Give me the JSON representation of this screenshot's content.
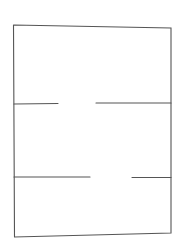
{
  "diagram": {
    "type": "floor-plan-sketch",
    "background": "#ffffff",
    "stroke_color": "#555555",
    "stroke_width": 1.1,
    "outer_wall": {
      "points": [
        [
          13.5,
          25
        ],
        [
          171,
          28
        ],
        [
          171,
          233
        ],
        [
          14.5,
          237
        ],
        [
          13.5,
          25
        ]
      ]
    },
    "partitions": [
      {
        "name": "upper-partition",
        "y": 103,
        "segments": [
          {
            "x1": 14,
            "y1": 104,
            "x2": 58,
            "y2": 103.5
          },
          {
            "x1": 96,
            "y1": 103,
            "x2": 171,
            "y2": 103
          }
        ],
        "opening": {
          "x1": 58,
          "x2": 96
        }
      },
      {
        "name": "lower-partition",
        "y": 177,
        "segments": [
          {
            "x1": 14,
            "y1": 177,
            "x2": 90,
            "y2": 177
          },
          {
            "x1": 132,
            "y1": 177.5,
            "x2": 171,
            "y2": 177.5
          }
        ],
        "opening": {
          "x1": 90,
          "x2": 132
        }
      }
    ],
    "rooms": [
      {
        "name": "top-room"
      },
      {
        "name": "middle-room"
      },
      {
        "name": "bottom-room"
      }
    ]
  }
}
